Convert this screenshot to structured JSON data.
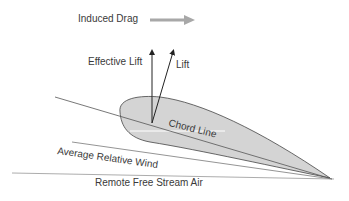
{
  "diagram": {
    "labels": {
      "induced_drag": "Induced Drag",
      "effective_lift": "Effective Lift",
      "lift": "Lift",
      "chord_line": "Chord Line",
      "average_relative_wind": "Average Relative Wind",
      "remote_free_stream_air": "Remote Free Stream Air"
    },
    "colors": {
      "airfoil_fill": "#d4d4d4",
      "line": "#555555",
      "drag_arrow": "#a8a8a8",
      "text": "#3a3a3a"
    }
  }
}
